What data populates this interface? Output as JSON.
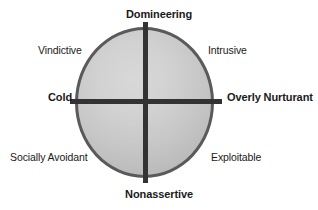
{
  "figure": {
    "type": "interpersonal-circumplex",
    "background_color": "#ffffff",
    "circle": {
      "fill_gradient_light": "#d8d8d8",
      "fill_gradient_dark": "#ababab",
      "stroke_color": "#5a5a5a"
    },
    "axis_color": "#333333",
    "text_color": "#1a1a1a"
  },
  "poles": {
    "top": "Domineering",
    "bottom": "Nonassertive",
    "left": "Cold",
    "right": "Overly Nurturant"
  },
  "octants": {
    "upper_left": "Vindictive",
    "upper_right": "Intrusive",
    "lower_left": "Socially Avoidant",
    "lower_right": "Exploitable"
  },
  "chart_data": {
    "type": "scatter",
    "title": "",
    "xlabel": "",
    "ylabel": "",
    "grid": false,
    "legend_position": "none",
    "axes": {
      "horizontal": {
        "negative_pole": "Cold",
        "positive_pole": "Overly Nurturant"
      },
      "vertical": {
        "positive_pole": "Domineering",
        "negative_pole": "Nonassertive"
      }
    },
    "categories": [
      "Domineering",
      "Intrusive",
      "Overly Nurturant",
      "Exploitable",
      "Nonassertive",
      "Socially Avoidant",
      "Cold",
      "Vindictive"
    ],
    "angles_deg": [
      90,
      45,
      0,
      315,
      270,
      225,
      180,
      135
    ],
    "values": [
      1,
      1,
      1,
      1,
      1,
      1,
      1,
      1
    ]
  }
}
